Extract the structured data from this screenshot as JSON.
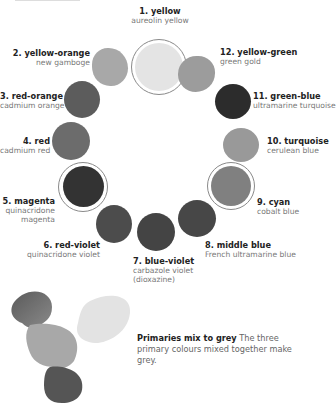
{
  "colors": [
    {
      "num": "1. yellow",
      "pigment": "aureolin yellow",
      "primary": true,
      "shade": "#e2e2e2"
    },
    {
      "num": "2. yellow-orange",
      "pigment": "new gamboge",
      "primary": false,
      "shade": "#a6a6a6"
    },
    {
      "num": "3. red-orange",
      "pigment": "cadmium orange",
      "primary": false,
      "shade": "#5e5e5e"
    },
    {
      "num": "4. red",
      "pigment": "cadmium red",
      "primary": false,
      "shade": "#6e6e6e"
    },
    {
      "num": "5. magenta",
      "pigment": "quinacridone magenta",
      "pigment_lines": [
        "quinacridone",
        "magenta"
      ],
      "primary": true,
      "shade": "#333333"
    },
    {
      "num": "6. red-violet",
      "pigment": "quinacridone violet",
      "primary": false,
      "shade": "#4e4e4e"
    },
    {
      "num": "7. blue-violet",
      "pigment": "carbazole violet (dioxazine)",
      "pigment_lines": [
        "carbazole violet",
        "(dioxazine)"
      ],
      "primary": false,
      "shade": "#474747"
    },
    {
      "num": "8. middle blue",
      "pigment": "French ultramarine blue",
      "primary": false,
      "shade": "#4a4a4a"
    },
    {
      "num": "9. cyan",
      "pigment": "cobalt blue",
      "primary": true,
      "shade": "#828282"
    },
    {
      "num": "10. turquoise",
      "pigment": "cerulean blue",
      "primary": false,
      "shade": "#9a9a9a"
    },
    {
      "num": "11. green-blue",
      "pigment": "ultramarine turquoise",
      "primary": false,
      "shade": "#2e2e2e"
    },
    {
      "num": "12. yellow-green",
      "pigment": "green gold",
      "primary": false,
      "shade": "#9e9e9e"
    }
  ],
  "caption": {
    "title": "Primaries mix to grey",
    "body": "The three primary colours mixed together make grey."
  }
}
